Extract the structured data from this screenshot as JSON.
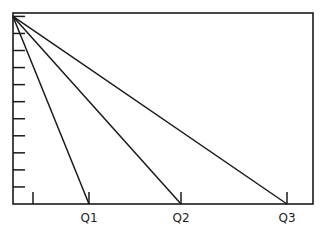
{
  "chart_data": {
    "type": "line",
    "title": "",
    "xlabel": "",
    "ylabel": "",
    "grid": false,
    "legend": "none",
    "xlim": [
      0,
      15
    ],
    "ylim": [
      0,
      11.2
    ],
    "x_ticks": [
      {
        "value": 1,
        "label": ""
      },
      {
        "value": 3.8,
        "label": "Q1"
      },
      {
        "value": 8.4,
        "label": "Q2"
      },
      {
        "value": 13.7,
        "label": "Q3"
      }
    ],
    "y_ticks": [
      1,
      2,
      3,
      4,
      5,
      6,
      7,
      8,
      9,
      10,
      11
    ],
    "series": [
      {
        "name": "Q1",
        "x": [
          0,
          3.8
        ],
        "y": [
          11,
          0
        ]
      },
      {
        "name": "Q2",
        "x": [
          0,
          8.4
        ],
        "y": [
          11,
          0
        ]
      },
      {
        "name": "Q3",
        "x": [
          0,
          13.7
        ],
        "y": [
          11,
          0
        ]
      }
    ],
    "colors": {
      "ink": "#1a1a1a"
    }
  }
}
